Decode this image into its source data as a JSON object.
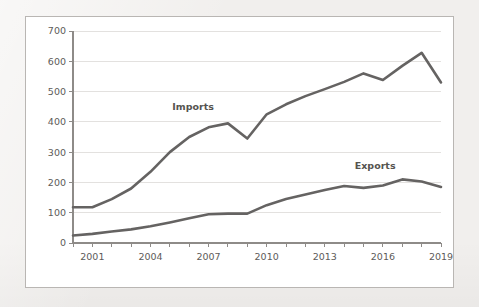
{
  "chart_data": {
    "type": "line",
    "title": "",
    "subtitle": "",
    "xlabel": "",
    "ylabel": "",
    "xlim": [
      2000,
      2019
    ],
    "ylim": [
      0,
      700
    ],
    "y_ticks": [
      0,
      100,
      200,
      300,
      400,
      500,
      600,
      700
    ],
    "y_tick_labels": [
      "0",
      "100",
      "200",
      "300",
      "400",
      "500",
      "600",
      "700"
    ],
    "x_ticks": [
      2000,
      2001,
      2002,
      2003,
      2004,
      2005,
      2006,
      2007,
      2008,
      2009,
      2010,
      2011,
      2012,
      2013,
      2014,
      2015,
      2016,
      2017,
      2018,
      2019
    ],
    "x_tick_labels": [
      "",
      "2001",
      "",
      "",
      "2004",
      "",
      "",
      "2007",
      "",
      "",
      "2010",
      "",
      "",
      "2013",
      "",
      "",
      "2016",
      "",
      "",
      "2019"
    ],
    "x_labelled_ticks": [
      "2001",
      "2004",
      "2007",
      "2010",
      "2013",
      "2016",
      "2019"
    ],
    "grid": true,
    "grid_axis": "y",
    "legend": "inline-labels",
    "line_color": "#656362",
    "gridline_color": "#e3e1df",
    "axis_color": "#8e8b88",
    "panel_background": "#ffffff",
    "page_background": "#f1efed",
    "x": [
      2000,
      2001,
      2002,
      2003,
      2004,
      2005,
      2006,
      2007,
      2008,
      2009,
      2010,
      2011,
      2012,
      2013,
      2014,
      2015,
      2016,
      2017,
      2018,
      2019
    ],
    "series": [
      {
        "name": "Imports",
        "label": "Imports",
        "color": "#656362",
        "values": [
          118,
          118,
          145,
          180,
          235,
          300,
          350,
          382,
          395,
          345,
          425,
          458,
          485,
          508,
          532,
          560,
          538,
          585,
          628,
          530
        ]
      },
      {
        "name": "Exports",
        "label": "Exports",
        "color": "#656362",
        "values": [
          25,
          30,
          38,
          45,
          55,
          68,
          82,
          95,
          97,
          97,
          125,
          145,
          160,
          175,
          188,
          182,
          190,
          210,
          203,
          185
        ]
      }
    ],
    "annotations": [
      {
        "text": "Imports",
        "x": 2006.2,
        "y": 440
      },
      {
        "text": "Exports",
        "x": 2015.6,
        "y": 243
      }
    ]
  }
}
